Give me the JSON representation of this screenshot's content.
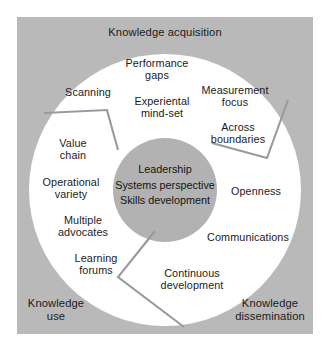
{
  "diagram": {
    "colors": {
      "panel_background": "#b9b9b9",
      "ring": "#ffffff",
      "core": "#b2b2b2",
      "divider": "#9a9a9a",
      "text": "#1b1b1b",
      "page_background": "#ffffff"
    },
    "core": {
      "lines": [
        "Leadership",
        "Systems perspective",
        "Skills development"
      ]
    },
    "outer_labels": [
      {
        "id": "knowledge-acquisition",
        "text": "Knowledge acquisition"
      },
      {
        "id": "knowledge-dissemination",
        "text": "Knowledge\ndissemination"
      },
      {
        "id": "knowledge-use",
        "text": "Knowledge\nuse"
      }
    ],
    "ring_labels": [
      {
        "id": "performance-gaps",
        "text": "Performance\ngaps"
      },
      {
        "id": "scanning",
        "text": "Scanning"
      },
      {
        "id": "experiental-mind-set",
        "text": "Experiental\nmind-set"
      },
      {
        "id": "measurement-focus",
        "text": "Measurement\nfocus"
      },
      {
        "id": "across-boundaries",
        "text": "Across\nboundaries"
      },
      {
        "id": "value-chain",
        "text": "Value\nchain"
      },
      {
        "id": "operational-variety",
        "text": "Operational\nvariety"
      },
      {
        "id": "openness",
        "text": "Openness"
      },
      {
        "id": "multiple-advocates",
        "text": "Multiple\nadvocates"
      },
      {
        "id": "communications",
        "text": "Communications"
      },
      {
        "id": "learning-forums",
        "text": "Learning\nforums"
      },
      {
        "id": "continuous-development",
        "text": "Continuous\ndevelopment"
      }
    ]
  }
}
